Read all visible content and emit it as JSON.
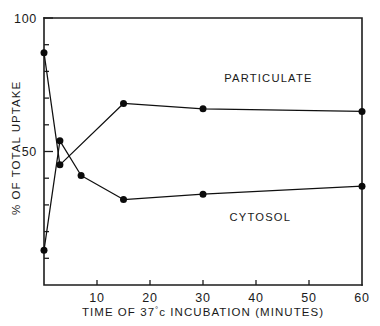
{
  "chart_data": {
    "type": "line",
    "title": "",
    "xlabel": "TIME OF 37°c INCUBATION (MINUTES)",
    "ylabel": "% OF TOTAL UPTAKE",
    "xlim": [
      0,
      60
    ],
    "ylim": [
      0,
      100
    ],
    "grid": false,
    "legend_position": "inline-right",
    "x_ticks": [
      10,
      20,
      30,
      40,
      50,
      60
    ],
    "x_tick_labels": [
      "10",
      "20",
      "30",
      "40",
      "50",
      "60"
    ],
    "x_minor_ticks": [],
    "y_ticks": [
      50,
      100
    ],
    "y_tick_labels": [
      "50",
      "100"
    ],
    "y_minor_ticks": [
      10,
      20,
      30,
      40,
      60,
      70,
      80,
      90
    ],
    "series": [
      {
        "name": "PARTICULATE",
        "x": [
          0,
          3,
          15,
          30,
          60
        ],
        "values": [
          87,
          45,
          68,
          66,
          65
        ],
        "marker": "filled-circle",
        "label_x": 34,
        "label_y": 76
      },
      {
        "name": "CYTOSOL",
        "x": [
          0,
          3,
          7,
          15,
          30,
          60
        ],
        "values": [
          13,
          54,
          41,
          32,
          34,
          37
        ],
        "marker": "filled-circle",
        "label_x": 35,
        "label_y": 24
      }
    ],
    "annotations": []
  },
  "axis_title_x": {
    "prefix": "TIME OF 37",
    "degree": "°",
    "middle": "c  INCUBATION  (MINUTES)"
  },
  "axis_title_y": "% OF TOTAL UPTAKE"
}
